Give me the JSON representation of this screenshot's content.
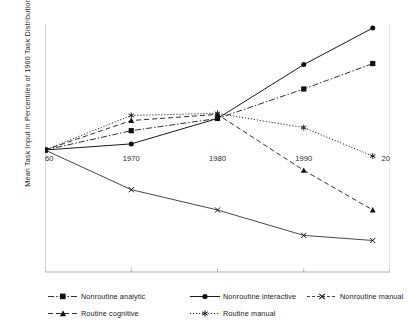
{
  "chart_data": {
    "type": "line",
    "title": "",
    "xlabel": "",
    "ylabel": "Mean Task Input in Percentiles of 1960 Task Distribution",
    "x": [
      1960,
      1970,
      1980,
      1990,
      1998
    ],
    "xticks": [
      1960,
      1970,
      1980,
      1990,
      2000
    ],
    "xtick_labels": [
      "1960",
      "1970",
      "1980",
      "1990",
      "2000"
    ],
    "xlim": [
      1960,
      2000
    ],
    "yticks": [
      38,
      40,
      42,
      44,
      46,
      48,
      50,
      52,
      54,
      56,
      58,
      60,
      62
    ],
    "ytick_labels": [
      "38",
      "40",
      "42",
      "44",
      "46",
      "48",
      "50",
      "52",
      "54",
      "56",
      "58",
      "60",
      "62"
    ],
    "ylim": [
      38,
      62
    ],
    "grid": false,
    "legend_position": "bottom",
    "series": [
      {
        "name": "Nonroutine analytic",
        "values": [
          50.0,
          51.9,
          53.1,
          56.0,
          58.5
        ],
        "marker": "square",
        "dash": "6,2,1.5,2",
        "width": 0.9,
        "color": "#1a1a1a"
      },
      {
        "name": "Nonroutine interactive",
        "values": [
          50.0,
          50.6,
          53.1,
          58.4,
          62.0
        ],
        "marker": "circle",
        "dash": "none",
        "width": 1.0,
        "color": "#1a1a1a"
      },
      {
        "name": "Nonroutine manual",
        "values": [
          50.0,
          46.1,
          44.1,
          41.6,
          41.1
        ],
        "marker": "cross",
        "dash": "none",
        "width": 0.8,
        "color": "#1a1a1a"
      },
      {
        "name": "Routine cognitive",
        "values": [
          50.0,
          52.9,
          53.5,
          48.0,
          44.1
        ],
        "marker": "triangle",
        "dash": "5,3",
        "width": 0.9,
        "color": "#1a1a1a"
      },
      {
        "name": "Routine manual",
        "values": [
          50.0,
          53.4,
          53.6,
          52.2,
          49.4
        ],
        "marker": "star",
        "dash": "1.2,1.8",
        "width": 0.9,
        "color": "#1a1a1a"
      }
    ]
  },
  "legend": {
    "items": [
      {
        "label": "Nonroutine analytic"
      },
      {
        "label": "Nonroutine interactive"
      },
      {
        "label": "Nonroutine manual"
      },
      {
        "label": "Routine cognitive"
      },
      {
        "label": "Routine manual"
      }
    ]
  }
}
